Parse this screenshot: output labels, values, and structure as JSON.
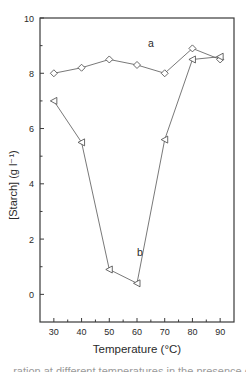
{
  "chart_data": {
    "type": "line",
    "title": "",
    "xlabel": "Temperature (°C)",
    "ylabel": "[Starch] (g l⁻¹)",
    "x": [
      30,
      40,
      50,
      60,
      70,
      80,
      90
    ],
    "xticks": [
      30,
      40,
      50,
      60,
      70,
      80,
      90
    ],
    "yticks": [
      0,
      2,
      4,
      6,
      8,
      10
    ],
    "xlim": [
      25,
      95
    ],
    "ylim": [
      -1,
      10
    ],
    "grid": false,
    "legend": "none (inline labels)",
    "series": [
      {
        "name": "a",
        "marker": "diamond",
        "values": [
          8.0,
          8.2,
          8.5,
          8.3,
          8.0,
          8.9,
          8.5
        ],
        "label_pos": {
          "x": 64,
          "y": 8.95
        }
      },
      {
        "name": "b",
        "marker": "triangle-left",
        "values": [
          7.0,
          5.5,
          0.9,
          0.4,
          5.6,
          8.5,
          8.6
        ],
        "label_pos": {
          "x": 60,
          "y": 1.4
        }
      }
    ],
    "annotations": [
      "a",
      "b"
    ]
  },
  "caption": "...ration at different temperatures in the presence of..."
}
